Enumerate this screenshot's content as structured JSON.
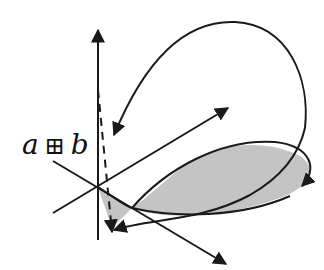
{
  "diagram": {
    "label": {
      "left": "a",
      "operator": "⊞",
      "right": "b"
    },
    "colors": {
      "stroke": "#1a1a1a",
      "fill": "#c4c4c4",
      "background": "#ffffff"
    },
    "elements": [
      "vertical-axis-arrow",
      "diagonal-axis-arrow-up-right",
      "diagonal-axis-arrow-down-right",
      "dashed-vertical-line",
      "upper-loop-curve-arrow",
      "shaded-petal-region",
      "inner-curve-arrow"
    ]
  }
}
